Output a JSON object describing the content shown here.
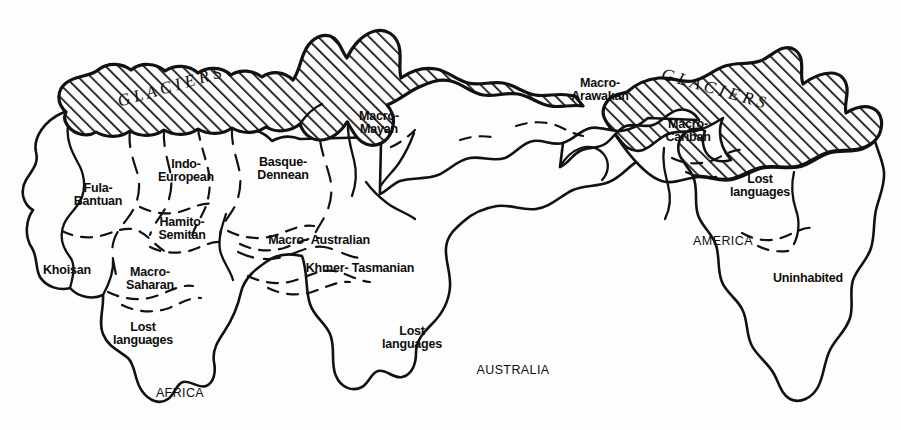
{
  "map": {
    "title": "Prehistoric language families and glaciers map",
    "background_color": "#fdfdfd",
    "ink_color": "#111111",
    "glacier_fill": "hatched-diagonal",
    "glacier_label_left": "G L A C I E R S",
    "glacier_label_right": "G L A C I E R S",
    "language_regions": [
      {
        "id": "fula-bantuan",
        "label": "Fula-\nBantuan",
        "x": 98,
        "y": 194
      },
      {
        "id": "khoisan",
        "label": "Khoisan",
        "x": 67,
        "y": 270
      },
      {
        "id": "macro-saharan",
        "label": "Macro-\nSaharan",
        "x": 150,
        "y": 278
      },
      {
        "id": "hamito-semitan",
        "label": "Hamito-\nSemitan",
        "x": 182,
        "y": 228
      },
      {
        "id": "indo-european",
        "label": "Indo-\nEuropean",
        "x": 186,
        "y": 170
      },
      {
        "id": "basque-dennean",
        "label": "Basque-\nDennean",
        "x": 283,
        "y": 168
      },
      {
        "id": "macro-mayan",
        "label": "Macro-\nMayan",
        "x": 379,
        "y": 122
      },
      {
        "id": "macro-australian",
        "label": "Macro- Australian",
        "x": 319,
        "y": 240
      },
      {
        "id": "khmer-tasmanian",
        "label": "Khmer- Tasmanian",
        "x": 360,
        "y": 268
      },
      {
        "id": "lost-africa",
        "label": "Lost\nlanguages",
        "x": 143,
        "y": 333
      },
      {
        "id": "lost-australia",
        "label": "Lost\nlanguages",
        "x": 412,
        "y": 337
      },
      {
        "id": "macro-arawakan",
        "label": "Macro-\nArawakan",
        "x": 600,
        "y": 89
      },
      {
        "id": "macro-cariban",
        "label": "Macro-\nCariban",
        "x": 688,
        "y": 130
      },
      {
        "id": "lost-america",
        "label": "Lost\nlanguages",
        "x": 760,
        "y": 185
      },
      {
        "id": "uninhabited",
        "label": "Uninhabited",
        "x": 808,
        "y": 278
      }
    ],
    "continent_labels": [
      {
        "id": "africa",
        "label": "AFRICA",
        "x": 180,
        "y": 393
      },
      {
        "id": "australia",
        "label": "AUSTRALIA",
        "x": 513,
        "y": 370
      },
      {
        "id": "america",
        "label": "AMERICA",
        "x": 723,
        "y": 241
      }
    ]
  }
}
